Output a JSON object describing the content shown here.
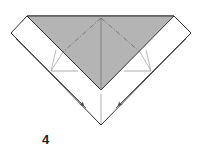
{
  "diagram": {
    "type": "origami-step",
    "step_number": "4",
    "colors": {
      "paper_white": "#ffffff",
      "paper_colored": "#b4b4b4",
      "edge": "#333333",
      "crease": "#8a8a8a",
      "dashed": "#6f6f6f",
      "arrow": "#555555"
    },
    "shapes": {
      "outer_paper": [
        [
          27,
          16
        ],
        [
          174,
          16
        ],
        [
          191,
          33
        ],
        [
          101,
          125
        ],
        [
          11,
          33
        ]
      ],
      "colored_triangle": [
        [
          27,
          16
        ],
        [
          174,
          16
        ],
        [
          101,
          90
        ]
      ],
      "left_flap_inner_edge": [
        [
          15,
          37
        ],
        [
          86,
          108
        ]
      ],
      "right_flap_inner_edge": [
        [
          187,
          37
        ],
        [
          116,
          108
        ]
      ],
      "center_crease": [
        [
          101,
          18
        ],
        [
          101,
          90
        ]
      ],
      "center_crease_lower": [
        [
          101,
          94
        ],
        [
          101,
          124
        ]
      ],
      "left_valley_dashed": [
        [
          101,
          18
        ],
        [
          63,
          52
        ]
      ],
      "right_valley_dashed": [
        [
          101,
          18
        ],
        [
          140,
          52
        ]
      ],
      "left_horizontal_crease": [
        [
          51,
          71
        ],
        [
          78,
          71
        ]
      ],
      "right_horizontal_crease": [
        [
          124,
          71
        ],
        [
          151,
          71
        ]
      ],
      "left_fan_creases": [
        [
          [
            51,
            71
          ],
          [
            56,
            50
          ]
        ],
        [
          [
            51,
            71
          ],
          [
            63,
            52
          ]
        ]
      ],
      "right_fan_creases": [
        [
          [
            151,
            71
          ],
          [
            146,
            50
          ]
        ],
        [
          [
            151,
            71
          ],
          [
            140,
            52
          ]
        ]
      ],
      "left_arrow": [
        [
          16,
          39
        ],
        [
          84,
          106
        ]
      ],
      "right_arrow": [
        [
          186,
          39
        ],
        [
          118,
          106
        ]
      ]
    }
  }
}
